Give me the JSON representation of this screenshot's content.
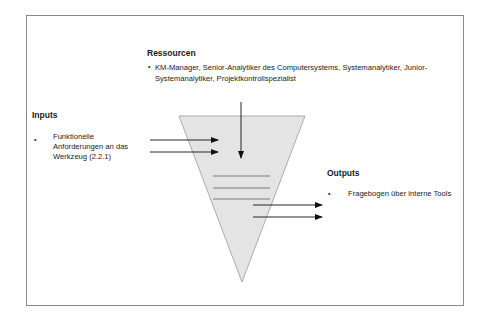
{
  "diagram": {
    "resources": {
      "heading": "Ressourcen",
      "items": [
        "KM-Manager, Senior-Analytiker des Computersystems, Systemanalytiker, Junior-Systemanalytiker, Projektkontrollspezialist"
      ],
      "line1": "KM-Manager, Senior-Analytiker des  Computersystems, Systemanalytiker, Junior-",
      "line2": "Systemanalytiker, Projektkontrollspezialist"
    },
    "inputs": {
      "heading": "Inputs",
      "items": [
        "Funktionelle Anforderungen an das Werkzeug (2.2.1)"
      ],
      "line1": "Funktionelle",
      "line2": "Anforderungen an das",
      "line3": "Werkzeug (2.2.1)"
    },
    "outputs": {
      "heading": "Outputs",
      "items": [
        "Fragebogen über interne Tools"
      ]
    },
    "bullet_char": "•",
    "colors": {
      "funnel_fill": "#e4e4e4",
      "funnel_stroke": "#9a9a9a",
      "arrow": "#111111",
      "inner_lines": "#7a7a7a",
      "frame": "#8a8a8a"
    }
  }
}
